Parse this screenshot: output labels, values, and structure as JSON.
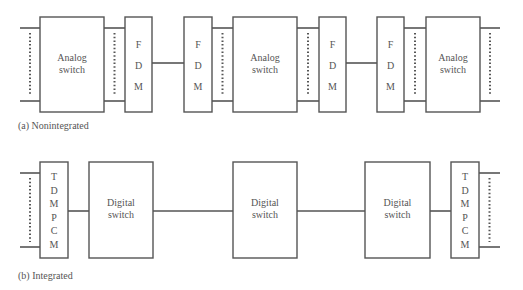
{
  "figure": {
    "nonintegrated": {
      "caption": "(a)  Nonintegrated",
      "blocks": [
        {
          "type": "switch",
          "lines": [
            "Analog",
            "switch"
          ]
        },
        {
          "type": "mux",
          "letters": [
            "F",
            "D",
            "M"
          ]
        },
        {
          "type": "mux",
          "letters": [
            "F",
            "D",
            "M"
          ]
        },
        {
          "type": "switch",
          "lines": [
            "Analog",
            "switch"
          ]
        },
        {
          "type": "mux",
          "letters": [
            "F",
            "D",
            "M"
          ]
        },
        {
          "type": "mux",
          "letters": [
            "F",
            "D",
            "M"
          ]
        },
        {
          "type": "switch",
          "lines": [
            "Analog",
            "switch"
          ]
        }
      ]
    },
    "integrated": {
      "caption": "(b)  Integrated",
      "blocks": [
        {
          "type": "mux",
          "letters": [
            "T",
            "D",
            "M",
            "P",
            "C",
            "M"
          ]
        },
        {
          "type": "switch",
          "lines": [
            "Digital",
            "switch"
          ]
        },
        {
          "type": "switch",
          "lines": [
            "Digital",
            "switch"
          ]
        },
        {
          "type": "switch",
          "lines": [
            "Digital",
            "switch"
          ]
        },
        {
          "type": "mux",
          "letters": [
            "T",
            "D",
            "M",
            "P",
            "C",
            "M"
          ]
        }
      ]
    }
  }
}
